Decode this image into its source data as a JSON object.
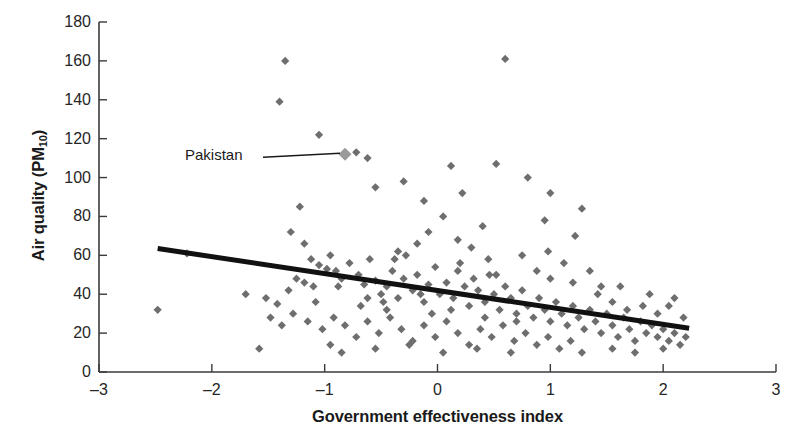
{
  "chart_data": {
    "type": "scatter",
    "title": "",
    "xlabel": "Government effectiveness index",
    "ylabel": "Air quality (PM10)",
    "ylabel_base": "Air quality (PM",
    "ylabel_sub": "10",
    "ylabel_close": ")",
    "xlim": [
      -3,
      3
    ],
    "ylim": [
      0,
      180
    ],
    "xticks": [
      -3,
      -2,
      -1,
      0,
      1,
      2,
      3
    ],
    "xtick_labels": [
      "–3",
      "–2",
      "–1",
      "0",
      "1",
      "2",
      "3"
    ],
    "yticks": [
      0,
      20,
      40,
      60,
      80,
      100,
      120,
      140,
      160,
      180
    ],
    "ytick_labels": [
      "0",
      "20",
      "40",
      "60",
      "80",
      "100",
      "120",
      "140",
      "160",
      "180"
    ],
    "grid": false,
    "legend": null,
    "marker_shape": "diamond",
    "marker_color": "#6e6e6e",
    "marker_size": 6,
    "trendline": {
      "label": "linear fit",
      "color": "#111111",
      "width": 5,
      "x_start": -2.48,
      "y_start": 63.5,
      "x_end": 2.23,
      "y_end": 22.5
    },
    "annotations": [
      {
        "text": "Pakistan",
        "label_x": -1.6,
        "label_y": 112,
        "point_x": -0.82,
        "point_y": 112,
        "highlight_color": "#9a9a9a",
        "leader_color": "#1a1a1a"
      }
    ],
    "points": [
      [
        -1.35,
        160
      ],
      [
        0.6,
        161
      ],
      [
        -1.4,
        139
      ],
      [
        -1.05,
        122
      ],
      [
        -0.82,
        112
      ],
      [
        -0.72,
        113
      ],
      [
        -0.62,
        110
      ],
      [
        -0.3,
        98
      ],
      [
        0.12,
        106
      ],
      [
        0.52,
        107
      ],
      [
        0.8,
        100
      ],
      [
        1.0,
        92
      ],
      [
        1.28,
        84
      ],
      [
        0.22,
        92
      ],
      [
        -0.12,
        88
      ],
      [
        -1.22,
        85
      ],
      [
        -1.3,
        72
      ],
      [
        -1.18,
        66
      ],
      [
        -0.95,
        60
      ],
      [
        -0.55,
        95
      ],
      [
        0.05,
        80
      ],
      [
        0.4,
        75
      ],
      [
        0.95,
        78
      ],
      [
        1.22,
        70
      ],
      [
        -2.22,
        61
      ],
      [
        -2.48,
        32
      ],
      [
        -1.58,
        12
      ],
      [
        -1.7,
        40
      ],
      [
        -1.52,
        38
      ],
      [
        -1.42,
        35
      ],
      [
        -1.32,
        42
      ],
      [
        -1.25,
        48
      ],
      [
        -1.18,
        46
      ],
      [
        -1.1,
        44
      ],
      [
        -1.05,
        55
      ],
      [
        -0.98,
        53
      ],
      [
        -0.9,
        52
      ],
      [
        -0.85,
        48
      ],
      [
        -0.78,
        56
      ],
      [
        -0.7,
        50
      ],
      [
        -0.65,
        45
      ],
      [
        -0.6,
        58
      ],
      [
        -0.55,
        47
      ],
      [
        -0.5,
        40
      ],
      [
        -0.45,
        44
      ],
      [
        -0.4,
        52
      ],
      [
        -0.35,
        38
      ],
      [
        -0.3,
        48
      ],
      [
        -0.28,
        60
      ],
      [
        -0.22,
        42
      ],
      [
        -0.18,
        50
      ],
      [
        -0.12,
        36
      ],
      [
        -0.08,
        45
      ],
      [
        -0.02,
        54
      ],
      [
        0.02,
        40
      ],
      [
        0.08,
        46
      ],
      [
        0.14,
        38
      ],
      [
        0.18,
        52
      ],
      [
        0.24,
        44
      ],
      [
        0.28,
        34
      ],
      [
        0.32,
        48
      ],
      [
        0.36,
        42
      ],
      [
        0.42,
        36
      ],
      [
        0.46,
        50
      ],
      [
        0.5,
        40
      ],
      [
        0.55,
        32
      ],
      [
        0.6,
        44
      ],
      [
        0.65,
        38
      ],
      [
        0.7,
        30
      ],
      [
        0.75,
        42
      ],
      [
        0.8,
        34
      ],
      [
        0.85,
        28
      ],
      [
        0.9,
        38
      ],
      [
        0.95,
        32
      ],
      [
        1.0,
        26
      ],
      [
        1.05,
        36
      ],
      [
        1.1,
        30
      ],
      [
        1.15,
        24
      ],
      [
        1.2,
        34
      ],
      [
        1.25,
        28
      ],
      [
        1.3,
        22
      ],
      [
        1.35,
        32
      ],
      [
        1.4,
        26
      ],
      [
        1.45,
        20
      ],
      [
        1.5,
        30
      ],
      [
        1.55,
        24
      ],
      [
        1.6,
        18
      ],
      [
        1.65,
        28
      ],
      [
        1.7,
        22
      ],
      [
        1.75,
        16
      ],
      [
        1.8,
        26
      ],
      [
        1.85,
        20
      ],
      [
        1.9,
        24
      ],
      [
        1.95,
        18
      ],
      [
        2.0,
        22
      ],
      [
        2.05,
        16
      ],
      [
        2.1,
        20
      ],
      [
        2.15,
        14
      ],
      [
        2.2,
        18
      ],
      [
        1.42,
        40
      ],
      [
        1.55,
        36
      ],
      [
        1.68,
        32
      ],
      [
        1.82,
        34
      ],
      [
        1.95,
        30
      ],
      [
        -1.48,
        28
      ],
      [
        -1.38,
        24
      ],
      [
        -1.28,
        30
      ],
      [
        -1.15,
        26
      ],
      [
        -1.02,
        22
      ],
      [
        -0.92,
        28
      ],
      [
        -0.82,
        24
      ],
      [
        -0.72,
        18
      ],
      [
        -0.62,
        26
      ],
      [
        -0.52,
        20
      ],
      [
        -0.42,
        28
      ],
      [
        -0.32,
        22
      ],
      [
        -0.22,
        16
      ],
      [
        -0.12,
        24
      ],
      [
        -0.02,
        18
      ],
      [
        0.08,
        26
      ],
      [
        0.18,
        20
      ],
      [
        0.28,
        14
      ],
      [
        0.38,
        22
      ],
      [
        0.48,
        18
      ],
      [
        0.58,
        24
      ],
      [
        0.68,
        16
      ],
      [
        0.78,
        20
      ],
      [
        0.88,
        14
      ],
      [
        0.98,
        18
      ],
      [
        1.08,
        12
      ],
      [
        1.18,
        16
      ],
      [
        1.28,
        10
      ],
      [
        -0.95,
        14
      ],
      [
        -0.85,
        10
      ],
      [
        -0.55,
        12
      ],
      [
        -0.25,
        14
      ],
      [
        0.05,
        10
      ],
      [
        0.35,
        12
      ],
      [
        0.65,
        10
      ],
      [
        1.55,
        12
      ],
      [
        1.75,
        10
      ],
      [
        2.0,
        12
      ],
      [
        2.18,
        28
      ],
      [
        -0.45,
        32
      ],
      [
        -0.35,
        62
      ],
      [
        -0.18,
        66
      ],
      [
        0.3,
        64
      ],
      [
        0.45,
        58
      ],
      [
        0.75,
        60
      ],
      [
        1.12,
        56
      ],
      [
        1.35,
        52
      ],
      [
        -0.08,
        72
      ],
      [
        0.18,
        68
      ],
      [
        -1.08,
        36
      ],
      [
        -0.68,
        34
      ],
      [
        -0.48,
        36
      ],
      [
        2.1,
        38
      ],
      [
        1.2,
        46
      ],
      [
        1.45,
        44
      ],
      [
        1.0,
        48
      ],
      [
        0.88,
        52
      ],
      [
        0.52,
        50
      ],
      [
        0.2,
        56
      ],
      [
        -0.05,
        30
      ],
      [
        0.12,
        32
      ],
      [
        0.42,
        28
      ],
      [
        0.7,
        26
      ],
      [
        -1.12,
        58
      ],
      [
        -0.88,
        44
      ],
      [
        -0.62,
        38
      ],
      [
        -0.38,
        58
      ],
      [
        -0.15,
        40
      ],
      [
        1.62,
        44
      ],
      [
        1.88,
        40
      ],
      [
        2.05,
        34
      ],
      [
        0.98,
        62
      ]
    ]
  }
}
